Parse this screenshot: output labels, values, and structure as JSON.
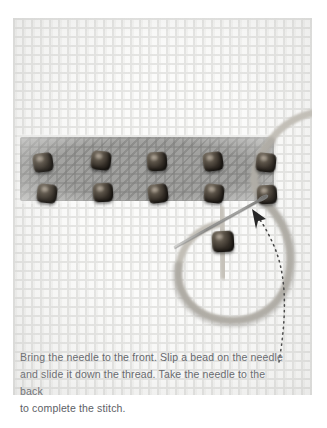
{
  "image": {
    "subject": "beaded-backstitch-tutorial-photo",
    "caption": "Bring the needle to the front. Slip a bead on the needle and slide it down the thread. Take the needle to the back to complete the stitch.",
    "colors": {
      "background": "#ffffff",
      "fabric": "#fbfbfa",
      "fabric_weave": "#e4e4e2",
      "stitched_band": "#9c9c9a",
      "bead": "#322c25",
      "bead_highlight": "#8e8579",
      "thread": "#b9b5ad",
      "needle": "#8a8a88",
      "arrow": "#3a3a3a",
      "caption_text": "#5d6166"
    }
  },
  "scene": {
    "fabric_label": "aida-cross-stitch-fabric",
    "band_label": "stitched-grey-band",
    "bead_rows": [
      {
        "row_label": "upper-bead-row",
        "count": 5,
        "beads": [
          {
            "x": 20,
            "y": 135,
            "tilt": "tilt-a"
          },
          {
            "x": 78,
            "y": 133,
            "tilt": "tilt-b"
          },
          {
            "x": 134,
            "y": 134,
            "tilt": "tilt-c"
          },
          {
            "x": 190,
            "y": 134,
            "tilt": "tilt-a"
          },
          {
            "x": 243,
            "y": 135,
            "tilt": "tilt-b"
          }
        ]
      },
      {
        "row_label": "lower-bead-row",
        "count": 5,
        "beads": [
          {
            "x": 24,
            "y": 166,
            "tilt": "tilt-b"
          },
          {
            "x": 80,
            "y": 165,
            "tilt": "tilt-c"
          },
          {
            "x": 135,
            "y": 166,
            "tilt": "tilt-a"
          },
          {
            "x": 191,
            "y": 166,
            "tilt": "tilt-b"
          },
          {
            "x": 244,
            "y": 167,
            "tilt": "tilt-c"
          }
        ]
      }
    ],
    "working_bead": {
      "label": "bead-on-needle",
      "x": 223,
      "y": 228,
      "tilt": "tilt-c"
    },
    "needle": {
      "label": "sewing-needle",
      "x1": 175,
      "y1": 247,
      "x2": 267,
      "y2": 196
    },
    "thread": {
      "label": "thread-loop"
    },
    "arrow": {
      "label": "dotted-direction-arrow",
      "tip_x": 254,
      "tip_y": 212,
      "tail_x": 279,
      "tail_y": 362
    }
  },
  "caption": {
    "line1": "Bring the needle to the front. Slip a bead on the needle",
    "line2": "and slide it down the thread. Take the needle to the back",
    "line3": "to complete the stitch."
  }
}
